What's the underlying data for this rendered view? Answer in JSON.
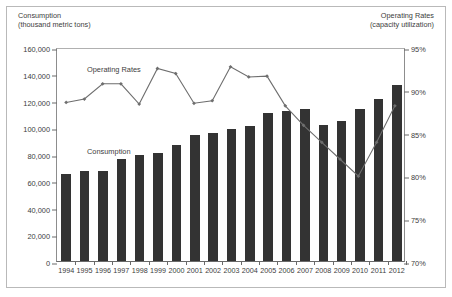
{
  "figure": {
    "left_axis_title_line1": "Consumption",
    "left_axis_title_line2": "(thousand metric tons)",
    "right_axis_title_line1": "Operating Rates",
    "right_axis_title_line2": "(capacity utilization)",
    "series_label_line": "Operating Rates",
    "series_label_bars": "Consumption",
    "bar_color": "#333333",
    "line_color": "#6e6e6e",
    "marker_color": "#6e6e6e",
    "axis_color": "#6a6a6a",
    "frame_color": "#b9b9b9"
  },
  "chart_data": {
    "type": "bar",
    "title": "",
    "subtitle": "",
    "xlabel": "",
    "ylabel": "Consumption (thousand metric tons)",
    "y2label": "Operating Rates (capacity utilization)",
    "grid": false,
    "legend_position": "inside-plot-annotations",
    "categories": [
      "1994",
      "1995",
      "1996",
      "1997",
      "1998",
      "1999",
      "2000",
      "2001",
      "2002",
      "2003",
      "2004",
      "2005",
      "2006",
      "2007",
      "2008",
      "2009",
      "2010",
      "2011",
      "2012"
    ],
    "ylim": [
      0,
      160000
    ],
    "yticks": [
      0,
      20000,
      40000,
      60000,
      80000,
      100000,
      120000,
      140000,
      160000
    ],
    "ytick_labels": [
      "0",
      "20,000",
      "40,000",
      "60,000",
      "80,000",
      "100,000",
      "120,000",
      "140,000",
      "160,000"
    ],
    "y2lim": [
      70,
      95
    ],
    "y2ticks": [
      70,
      75,
      80,
      85,
      90,
      95
    ],
    "y2tick_labels": [
      "70%",
      "75%",
      "80%",
      "85%",
      "90%",
      "95%"
    ],
    "series": [
      {
        "name": "Consumption",
        "type": "bar",
        "axis": "left",
        "unit": "thousand metric tons",
        "values": [
          65000,
          67500,
          67000,
          76000,
          79500,
          80500,
          87000,
          94500,
          95500,
          98500,
          101000,
          110500,
          112500,
          113500,
          102000,
          105000,
          113500,
          121000,
          131500
        ]
      },
      {
        "name": "Operating Rates",
        "type": "line",
        "axis": "right",
        "unit": "percent capacity utilization",
        "values": [
          88.7,
          89.1,
          90.9,
          90.9,
          88.5,
          92.7,
          92.1,
          88.6,
          88.9,
          92.9,
          91.7,
          91.8,
          88.3,
          86.0,
          84.0,
          82.0,
          80.0,
          84.0,
          88.3
        ]
      }
    ]
  }
}
